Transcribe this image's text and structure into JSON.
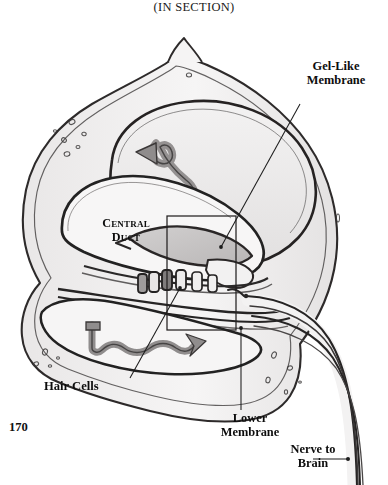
{
  "figure": {
    "title": "(IN SECTION)",
    "title_first_letters": "IS",
    "page_number": "170",
    "style": "pencil-graphite-sketch",
    "colors": {
      "ink": "#1a1a1a",
      "outline": "#2b2b2b",
      "shade_light": "#eceaea",
      "shade_mid": "#d8d6d6",
      "shade_dark": "#a7a4a4",
      "paper": "#ffffff",
      "leader": "#1c1c1c"
    }
  },
  "labels": {
    "gel_membrane": "Gel-Like\nMembrane",
    "central_duct": "Central\nDuct",
    "hair_cells": "Hair Cells",
    "lower_membrane": "Lower\nMembrane",
    "nerve_to_brain": "Nerve to\nBrain"
  },
  "leaders": [
    {
      "name": "gel-membrane-leader",
      "from": [
        300,
        104
      ],
      "to": [
        221,
        247
      ],
      "dot": true
    },
    {
      "name": "hair-cells-leader",
      "from": [
        130,
        378
      ],
      "to": [
        180,
        288
      ],
      "dot": true
    },
    {
      "name": "lower-membrane-leader",
      "from": [
        241,
        410
      ],
      "to": [
        241,
        328
      ],
      "dot": true
    },
    {
      "name": "nerve-to-brain-leader",
      "from": [
        313,
        459
      ],
      "to": [
        348,
        459
      ],
      "dot": true
    }
  ],
  "inset_box": {
    "name": "detail-rectangle",
    "x": 167,
    "y": 216,
    "w": 69,
    "h": 114
  },
  "anatomy_parts": [
    "outer-bone-wall",
    "upper-vestibular-chamber",
    "central-duct-chamber",
    "lower-tympanic-chamber",
    "gel-like-membrane",
    "hair-cell-row",
    "lower-basilar-membrane",
    "upper-fluid-wave-arrow",
    "lower-fluid-wave-arrow",
    "nerve-bundle",
    "bone-cell-speckles"
  ]
}
